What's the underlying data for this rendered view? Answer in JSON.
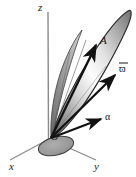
{
  "figure": {
    "kind": "3d-vector-diagram",
    "background_color": "#ffffff",
    "axes": {
      "z_label": "z",
      "x_label": "x",
      "y_label": "y",
      "axis_color": "#7f7f7f",
      "origin_label": "O"
    },
    "vectors": [
      {
        "name": "A",
        "label": "A",
        "description": "angular-momentum-vector-inside-cone"
      },
      {
        "name": "omega",
        "label": "ϖ",
        "description": "angular-velocity-vector"
      },
      {
        "name": "alpha",
        "label": "α",
        "description": "angular-acceleration-vector"
      }
    ],
    "body": {
      "name": "elongated-spindle-cone",
      "fill_light": "#fbfbfb",
      "fill_mid": "#9b9b9b",
      "fill_dark": "#5e5e5e",
      "outline_color": "#3a3a3a"
    },
    "base_ellipse": {
      "name": "base-ellipse-at-origin",
      "fill": "#9a9a9a"
    }
  }
}
